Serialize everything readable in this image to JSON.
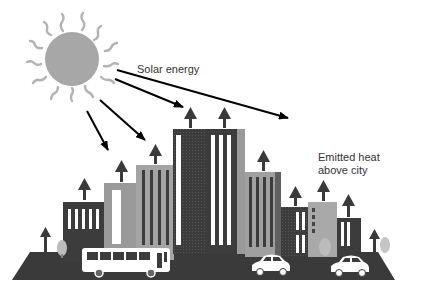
{
  "diagram": {
    "labels": {
      "solar": "Solar energy",
      "emitted_line1": "Emitted heat",
      "emitted_line2": "above city"
    },
    "colors": {
      "sun": "#a7a7a7",
      "rays": "#b0b0b0",
      "dark_building": "#3c3c3c",
      "mid_building": "#8d8d8d",
      "light_building": "#a9a9a9",
      "ground": "#3a3a3a",
      "arrow": "#000000",
      "heat_arrow": "#3a3a3a"
    },
    "icons": [
      "sun-icon",
      "bus-icon",
      "car-icon",
      "tree-icon",
      "heat-arrow-icon",
      "solar-arrow-icon"
    ]
  }
}
